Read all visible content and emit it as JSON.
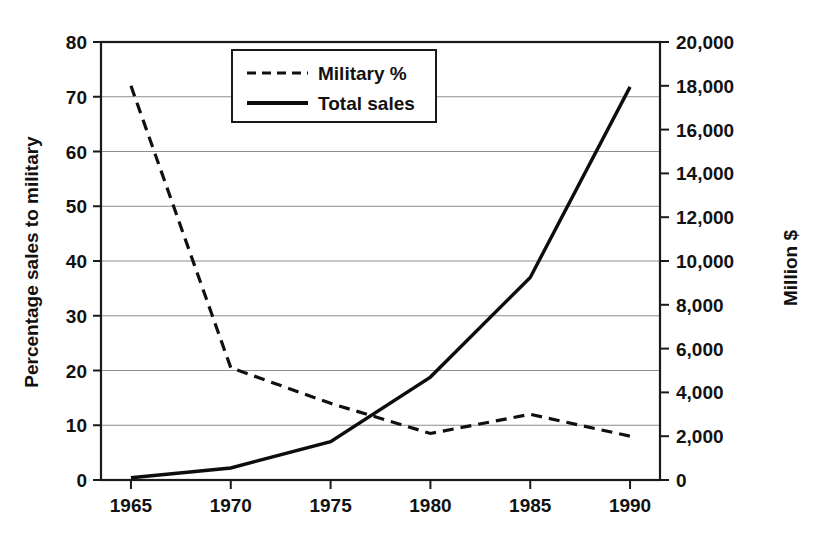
{
  "chart_data": {
    "type": "line",
    "title": "",
    "subtitle": "",
    "xlabel": "",
    "ylabel": "Percentage sales to military",
    "y2label": "Million $",
    "grid": true,
    "legend_position": "top-center-right",
    "x": [
      1965,
      1970,
      1975,
      1980,
      1985,
      1990
    ],
    "categories": [
      "1965",
      "1970",
      "1975",
      "1980",
      "1985",
      "1990"
    ],
    "xlim": [
      1963.5,
      1991.5
    ],
    "ylim": [
      0,
      80
    ],
    "y2lim": [
      0,
      20000
    ],
    "yticks": [
      0,
      10,
      20,
      30,
      40,
      50,
      60,
      70,
      80
    ],
    "ytick_labels": [
      "0",
      "10",
      "20",
      "30",
      "40",
      "50",
      "60",
      "70",
      "80"
    ],
    "y2ticks": [
      0,
      2000,
      4000,
      6000,
      8000,
      10000,
      12000,
      14000,
      16000,
      18000,
      20000
    ],
    "y2tick_labels": [
      "0",
      "2,000",
      "4,000",
      "6,000",
      "8,000",
      "10,000",
      "12,000",
      "14,000",
      "16,000",
      "18,000",
      "20,000"
    ],
    "xticks": [
      1965,
      1970,
      1975,
      1980,
      1985,
      1990
    ],
    "xtick_labels": [
      "1965",
      "1970",
      "1975",
      "1980",
      "1985",
      "1990"
    ],
    "series": [
      {
        "name": "Military %",
        "axis": "left",
        "style": "dashed",
        "color": "#101010",
        "values": [
          72,
          20.5,
          14,
          8.5,
          12,
          8
        ]
      },
      {
        "name": "Total sales",
        "axis": "right",
        "style": "solid",
        "color": "#0d0d0d",
        "values": [
          100,
          550,
          1750,
          4700,
          9250,
          17950
        ]
      }
    ]
  },
  "legend": {
    "entries": [
      {
        "label": "Military %",
        "style": "dashed"
      },
      {
        "label": "Total sales",
        "style": "solid"
      }
    ]
  },
  "axes": {
    "left_title": "Percentage sales to military",
    "right_title": "Million $"
  },
  "colors": {
    "background": "#ffffff",
    "ink": "#111111",
    "gridline": "#8e8e8e"
  }
}
